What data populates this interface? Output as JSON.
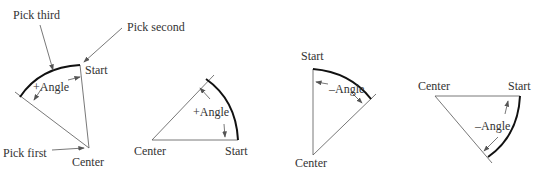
{
  "diagram": {
    "panels": [
      {
        "id": "pick-order",
        "labels": {
          "pick_third": "Pick third",
          "pick_second": "Pick second",
          "pick_first": "Pick first",
          "start": "Start",
          "center": "Center",
          "angle": "+Angle"
        }
      },
      {
        "id": "positive-angle",
        "labels": {
          "center": "Center",
          "start": "Start",
          "angle": "+Angle"
        }
      },
      {
        "id": "negative-angle-vertical",
        "labels": {
          "start": "Start",
          "center": "Center",
          "angle": "–Angle"
        }
      },
      {
        "id": "negative-angle-horizontal",
        "labels": {
          "center": "Center",
          "start": "Start",
          "angle": "–Angle"
        }
      }
    ]
  }
}
